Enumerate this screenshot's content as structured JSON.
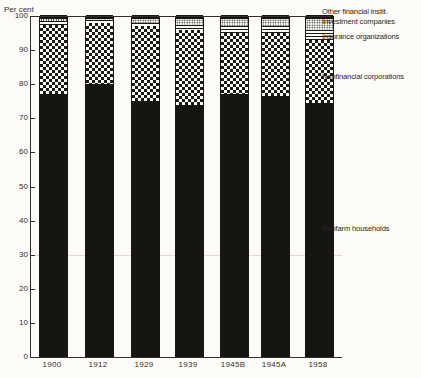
{
  "colors": {
    "ink": "#33302a",
    "bar_black": "#171512",
    "background": "#fcfbf8"
  },
  "chart_data": {
    "type": "bar",
    "stacked": true,
    "title": "",
    "ylabel": "Per cent",
    "xlabel": "",
    "ylim": [
      0,
      100
    ],
    "yticks": [
      0,
      10,
      20,
      30,
      40,
      50,
      60,
      70,
      80,
      90,
      100
    ],
    "grid": "off",
    "legend_position": "right",
    "categories": [
      "1900",
      "1912",
      "1929",
      "1939",
      "1945B",
      "1945A",
      "1958"
    ],
    "series": [
      {
        "name": "Nonfarm households",
        "pattern": "solid-black",
        "values": [
          77,
          80,
          75,
          74,
          77,
          76.5,
          74.5
        ]
      },
      {
        "name": "Nonfinancial corporations",
        "pattern": "checker",
        "values": [
          20.5,
          18,
          22,
          22,
          18,
          18.5,
          18.5
        ]
      },
      {
        "name": "Insurance organizations",
        "pattern": "hlines",
        "values": [
          1,
          0.7,
          1,
          1.5,
          2,
          2,
          3
        ]
      },
      {
        "name": "Investment companies",
        "pattern": "dots",
        "values": [
          0.5,
          0.5,
          1,
          1.5,
          2,
          2,
          3
        ]
      },
      {
        "name": "Other financial instit.",
        "pattern": "solid-black",
        "values": [
          1,
          0.8,
          1,
          1,
          1,
          1,
          1
        ]
      }
    ],
    "legend_labels": [
      "Other financial instit.",
      "Investment companies",
      "Insurance organizations",
      "Nonfinancial corporations",
      "Nonfarm households"
    ]
  }
}
